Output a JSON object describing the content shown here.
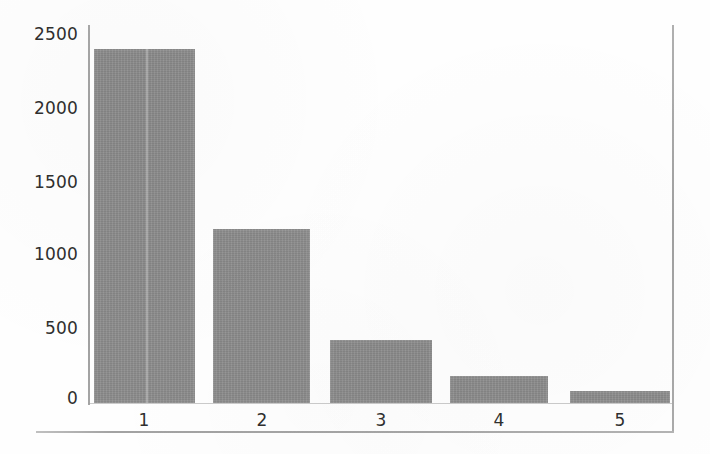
{
  "chart_data": {
    "type": "bar",
    "title": "",
    "subtitle": "",
    "xlabel": "",
    "ylabel": "",
    "categories": [
      "1",
      "2",
      "3",
      "4",
      "5"
    ],
    "values": [
      2400,
      1180,
      430,
      180,
      80
    ],
    "series": [
      {
        "name": "count",
        "values": [
          2400,
          1180,
          430,
          180,
          80
        ]
      }
    ],
    "ylim": [
      0,
      2500
    ],
    "xlim": null,
    "y_ticks": [
      0,
      500,
      1000,
      1500,
      2000,
      2500
    ],
    "y_tick_labels": [
      "0",
      "500",
      "1000",
      "1500",
      "2000",
      "2500"
    ],
    "x_tick_labels": [
      "1",
      "2",
      "3",
      "4",
      "5"
    ],
    "grid": false,
    "legend": null,
    "legend_position": "none",
    "annotations": [],
    "bar_color": "#8c8c8c",
    "axis_color": "#9d9d9d",
    "text_color": "#2f2f2f",
    "background_color": "#fefefe"
  },
  "axes": {
    "y_labels": [
      {
        "text": "2500",
        "value": 2500
      },
      {
        "text": "2000",
        "value": 2000
      },
      {
        "text": "1500",
        "value": 1500
      },
      {
        "text": "1000",
        "value": 1000
      },
      {
        "text": "500",
        "value": 500
      },
      {
        "text": "0",
        "value": 0
      }
    ],
    "x_labels": [
      {
        "text": "1"
      },
      {
        "text": "2"
      },
      {
        "text": "3"
      },
      {
        "text": "4"
      },
      {
        "text": "5"
      }
    ]
  }
}
